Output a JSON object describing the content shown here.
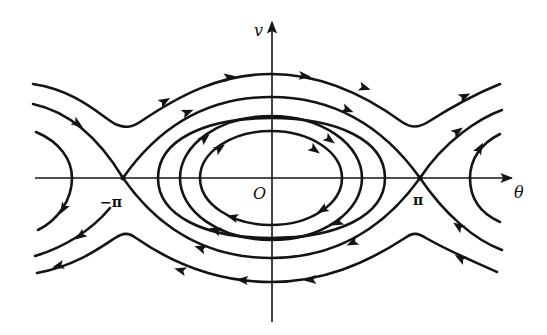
{
  "diagram": {
    "axes": {
      "horizontal_label": "θ",
      "vertical_label": "v",
      "origin_label": "O"
    },
    "markers": {
      "left_saddle_label": "−π",
      "right_saddle_label": "π"
    },
    "colors": {
      "ink": "#141414",
      "background": "#ffffff"
    },
    "elements": [
      "closed orbits around origin (clockwise flow)",
      "separatrices through saddle points at −π and π",
      "rotating trajectories above (flow right) and below (flow left)",
      "partial orbits around neighboring centers at ±2π"
    ]
  }
}
